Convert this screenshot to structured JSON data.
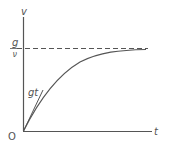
{
  "diagram": {
    "y_axis_label": "v",
    "x_axis_label": "t",
    "origin_label": "O",
    "asymptote_label": {
      "numerator": "g",
      "denominator": "ν"
    },
    "tangent_label": "gt",
    "colors": {
      "line": "#555555",
      "background": "#ffffff"
    }
  }
}
